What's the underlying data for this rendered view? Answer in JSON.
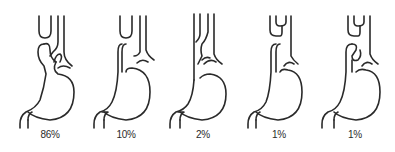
{
  "diagram": {
    "type": "esophagus-stomach anatomical variants",
    "panels": [
      {
        "id": "variant-1",
        "label": "86%",
        "label_x": 50
      },
      {
        "id": "variant-2",
        "label": "10%",
        "label_x": 126
      },
      {
        "id": "variant-3",
        "label": "2%",
        "label_x": 203
      },
      {
        "id": "variant-4",
        "label": "1%",
        "label_x": 279
      },
      {
        "id": "variant-5",
        "label": "1%",
        "label_x": 355
      }
    ],
    "line_color": "#2a2a2a",
    "background": "#ffffff"
  }
}
